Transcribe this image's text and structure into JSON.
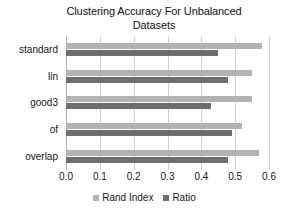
{
  "chart_data": {
    "type": "bar",
    "orientation": "horizontal",
    "title": "Clustering Accuracy For Unbalanced Datasets",
    "title_line1": "Clustering Accuracy For Unbalanced",
    "title_line2": "Datasets",
    "xlabel": "",
    "ylabel": "",
    "categories": [
      "standard",
      "lin",
      "good3",
      "of",
      "overlap"
    ],
    "series": [
      {
        "name": "Rand Index",
        "color": "#b3b3b3",
        "values": [
          0.58,
          0.55,
          0.55,
          0.52,
          0.57
        ]
      },
      {
        "name": "Ratio",
        "color": "#6e6e6e",
        "values": [
          0.45,
          0.48,
          0.43,
          0.49,
          0.48
        ]
      }
    ],
    "xlim": [
      0.0,
      0.6
    ],
    "xticks": [
      "0.0",
      "0.1",
      "0.2",
      "0.3",
      "0.4",
      "0.5",
      "0.6"
    ],
    "xtick_values": [
      0.0,
      0.1,
      0.2,
      0.3,
      0.4,
      0.5,
      0.6
    ],
    "grid": "vertical",
    "legend_position": "bottom"
  }
}
